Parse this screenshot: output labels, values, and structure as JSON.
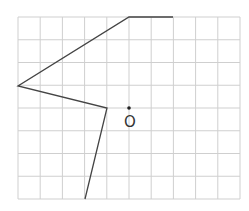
{
  "diagram": {
    "type": "grid-figure",
    "grid": {
      "left": 18,
      "top": 17,
      "right": 240,
      "bottom": 199,
      "columns": 10,
      "rows": 8,
      "line_color": "#cfcfcf"
    },
    "polyline": {
      "points": [
        [
          173,
          17
        ],
        [
          129,
          17
        ],
        [
          18,
          86
        ],
        [
          107,
          108
        ],
        [
          85,
          199
        ]
      ],
      "color": "#444444",
      "width": 1.3
    },
    "point_O": {
      "label": "O",
      "x": 129,
      "y": 108,
      "label_x": 124,
      "label_y": 127,
      "color": "#222222"
    }
  }
}
